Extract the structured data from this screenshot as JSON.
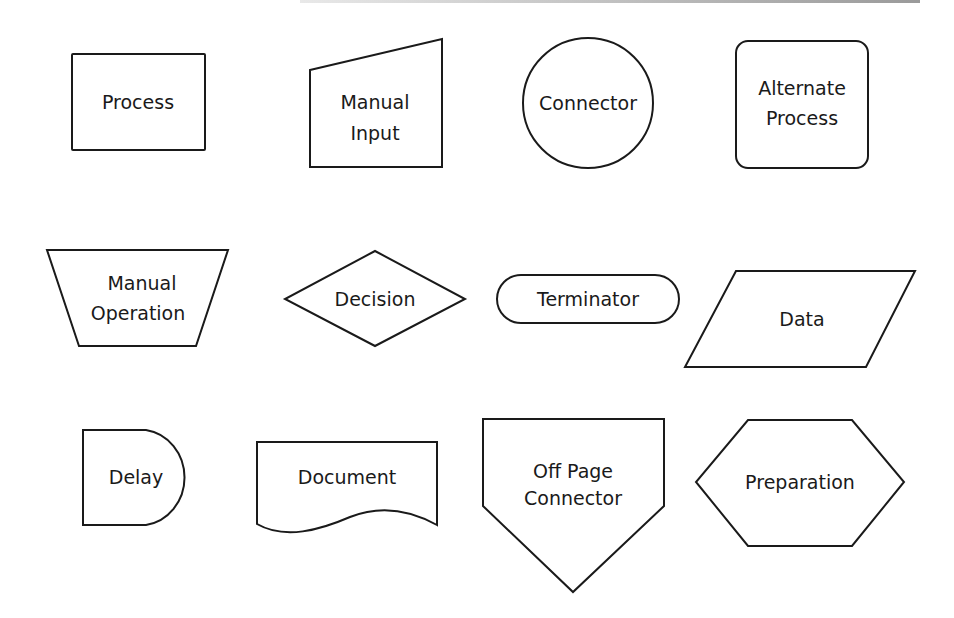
{
  "colors": {
    "stroke": "#1a1a1a",
    "fill": "#ffffff",
    "text": "#1a1a1a"
  },
  "symbols": [
    {
      "id": "process",
      "lines": [
        "Process"
      ]
    },
    {
      "id": "manual-input",
      "lines": [
        "Manual",
        "Input"
      ]
    },
    {
      "id": "connector",
      "lines": [
        "Connector"
      ]
    },
    {
      "id": "alternate-process",
      "lines": [
        "Alternate",
        "Process"
      ]
    },
    {
      "id": "manual-operation",
      "lines": [
        "Manual",
        "Operation"
      ]
    },
    {
      "id": "decision",
      "lines": [
        "Decision"
      ]
    },
    {
      "id": "terminator",
      "lines": [
        "Terminator"
      ]
    },
    {
      "id": "data",
      "lines": [
        "Data"
      ]
    },
    {
      "id": "delay",
      "lines": [
        "Delay"
      ]
    },
    {
      "id": "document",
      "lines": [
        "Document"
      ]
    },
    {
      "id": "off-page-connector",
      "lines": [
        "Off Page",
        "Connector"
      ]
    },
    {
      "id": "preparation",
      "lines": [
        "Preparation"
      ]
    }
  ]
}
